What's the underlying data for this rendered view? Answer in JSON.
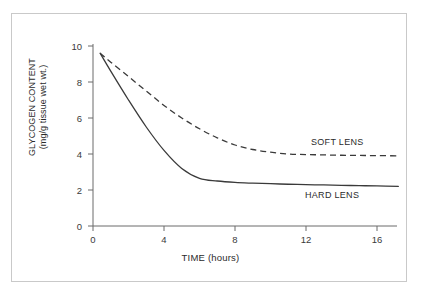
{
  "figure": {
    "border_color": "#c9c9c9",
    "background": "#ffffff",
    "axis_color": "#6b6b6b",
    "curve_color": "#3a3a3a"
  },
  "axes": {
    "x_title": "TIME (hours)",
    "y_title_line1": "GLYCOGEN CONTENT",
    "y_title_line2": "(mg/g tissue wet wt.)",
    "x_ticks": [
      "0",
      "4",
      "8",
      "12",
      "16"
    ],
    "y_ticks": [
      "0",
      "2",
      "4",
      "6",
      "8",
      "10"
    ]
  },
  "labels": {
    "soft_lens": "SOFT LENS",
    "hard_lens": "HARD LENS"
  },
  "chart_data": {
    "type": "line",
    "title": "",
    "xlabel": "TIME (hours)",
    "ylabel": "GLYCOGEN CONTENT (mg/g tissue wet wt.)",
    "xlim": [
      0,
      17.5
    ],
    "ylim": [
      0,
      10
    ],
    "xticks": [
      0,
      4,
      8,
      12,
      16
    ],
    "yticks": [
      0,
      2,
      4,
      6,
      8,
      10
    ],
    "grid": false,
    "legend_position": "inline-annotations",
    "annotations": [
      {
        "text": "SOFT LENS",
        "x": 12.3,
        "y": 4.9
      },
      {
        "text": "HARD LENS",
        "x": 12.0,
        "y": 2.0
      }
    ],
    "series": [
      {
        "name": "SOFT LENS",
        "style": "dashed",
        "x": [
          0.4,
          1,
          2,
          3,
          4,
          5,
          6,
          7,
          8,
          9,
          10,
          11,
          12,
          13,
          14,
          15,
          16,
          17.2
        ],
        "y": [
          9.6,
          9.1,
          8.3,
          7.5,
          6.7,
          6.0,
          5.4,
          4.9,
          4.5,
          4.25,
          4.1,
          4.0,
          3.97,
          3.95,
          3.93,
          3.92,
          3.91,
          3.9
        ]
      },
      {
        "name": "HARD LENS",
        "style": "solid",
        "x": [
          0.4,
          1,
          2,
          3,
          4,
          5,
          6,
          7,
          8,
          9,
          10,
          11,
          12,
          13,
          14,
          15,
          16,
          17.2
        ],
        "y": [
          9.6,
          8.6,
          7.0,
          5.5,
          4.2,
          3.2,
          2.65,
          2.5,
          2.42,
          2.38,
          2.35,
          2.32,
          2.3,
          2.28,
          2.26,
          2.24,
          2.23,
          2.2
        ]
      }
    ]
  }
}
